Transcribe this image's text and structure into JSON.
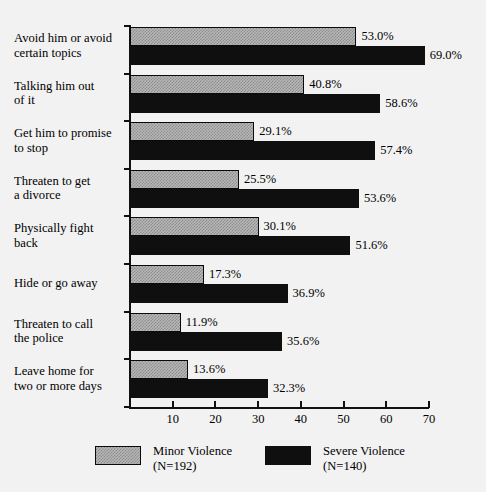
{
  "chart_data": {
    "type": "bar",
    "orientation": "horizontal",
    "title": "",
    "subtitle": "",
    "xlabel": "",
    "ylabel": "",
    "xlim": [
      0,
      70
    ],
    "xticks": [
      0,
      10,
      20,
      30,
      40,
      50,
      60,
      70
    ],
    "xtick_labels": [
      "",
      "10",
      "20",
      "30",
      "40",
      "50",
      "60",
      "70"
    ],
    "grid": false,
    "legend_position": "bottom",
    "categories": [
      "Avoid him or avoid certain topics",
      "Talking him out of it",
      "Get him to promise to stop",
      "Threaten to get a divorce",
      "Physically fight back",
      "Hide or go away",
      "Threaten to call the police",
      "Leave home for two or more days"
    ],
    "category_lines": [
      [
        "Avoid him or avoid",
        "certain topics"
      ],
      [
        "Talking him out",
        "of it"
      ],
      [
        "Get him to promise",
        "to stop"
      ],
      [
        "Threaten to get",
        "a divorce"
      ],
      [
        "Physically fight",
        "back"
      ],
      [
        "Hide or go away",
        ""
      ],
      [
        "Threaten to call",
        "the police"
      ],
      [
        "Leave home for",
        "two or more days"
      ]
    ],
    "series": [
      {
        "name": "Minor Violence",
        "n": "N=192",
        "color": "#b8b8b8",
        "values": [
          53.0,
          40.8,
          29.1,
          25.5,
          30.1,
          17.3,
          11.9,
          13.6
        ],
        "labels": [
          "53.0%",
          "40.8%",
          "29.1%",
          "25.5%",
          "30.1%",
          "17.3%",
          "11.9%",
          "13.6%"
        ]
      },
      {
        "name": "Severe Violence",
        "n": "N=140",
        "color": "#100f0f",
        "values": [
          69.0,
          58.6,
          57.4,
          53.6,
          51.6,
          36.9,
          35.6,
          32.3
        ],
        "labels": [
          "69.0%",
          "58.6%",
          "57.4%",
          "53.6%",
          "51.6%",
          "36.9%",
          "35.6%",
          "32.3%"
        ]
      }
    ]
  },
  "legend": {
    "minor": {
      "name": "Minor Violence",
      "n": "(N=192)"
    },
    "severe": {
      "name": "Severe Violence",
      "n": "(N=140)"
    }
  }
}
